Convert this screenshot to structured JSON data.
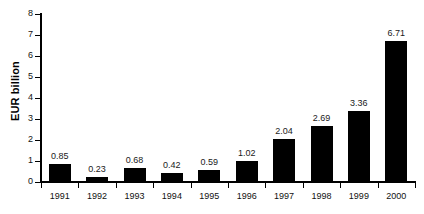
{
  "chart_data": {
    "type": "bar",
    "title": "",
    "subtitle": "",
    "xlabel": "",
    "ylabel": "EUR billion",
    "categories": [
      "1991",
      "1992",
      "1993",
      "1994",
      "1995",
      "1996",
      "1997",
      "1998",
      "1999",
      "2000"
    ],
    "values": [
      0.85,
      0.23,
      0.68,
      0.42,
      0.59,
      1.02,
      2.04,
      2.69,
      3.36,
      6.71
    ],
    "data_labels": [
      "0.85",
      "0.23",
      "0.68",
      "0.42",
      "0.59",
      "1.02",
      "2.04",
      "2.69",
      "3.36",
      "6.71"
    ],
    "ylim": [
      0,
      8
    ],
    "y_ticks": [
      0,
      1,
      2,
      3,
      4,
      5,
      6,
      7,
      8
    ],
    "y_tick_labels": [
      "0",
      "1",
      "2",
      "3",
      "4",
      "5",
      "6",
      "7",
      "8"
    ],
    "grid": false,
    "legend": false,
    "legend_position": "none",
    "bar_color": "#000000",
    "axis_color": "#000000",
    "background_color": "#ffffff",
    "label_color": "#1a1a1a"
  }
}
